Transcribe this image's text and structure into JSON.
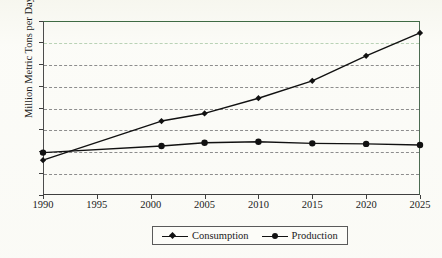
{
  "chart_data": {
    "type": "line",
    "title": "",
    "xlabel": "",
    "ylabel": "Million Metric Tons per Day",
    "xlim": [
      1990,
      2025
    ],
    "ylim": [
      0,
      1.6
    ],
    "ytick_labels": [
      "1.6",
      "1.4",
      "1.2",
      "1",
      "0.8",
      "0.6",
      "0.4",
      "0.2",
      "0"
    ],
    "ytick_values": [
      1.6,
      1.4,
      1.2,
      1.0,
      0.8,
      0.6,
      0.4,
      0.2,
      0
    ],
    "xtick_labels": [
      "1990",
      "1995",
      "2000",
      "2005",
      "2010",
      "2015",
      "2020",
      "2025"
    ],
    "xtick_values": [
      1990,
      1995,
      2000,
      2005,
      2010,
      2015,
      2020,
      2025
    ],
    "grid": true,
    "grid_style": "dashed",
    "legend_position": "bottom-center",
    "x": [
      1990,
      2001,
      2005,
      2010,
      2015,
      2020,
      2025
    ],
    "series": [
      {
        "name": "Consumption",
        "marker": "diamond",
        "color": "#111111",
        "values": [
          0.32,
          0.68,
          0.75,
          0.89,
          1.05,
          1.28,
          1.49
        ]
      },
      {
        "name": "Production",
        "marker": "circle",
        "color": "#111111",
        "values": [
          0.39,
          0.45,
          0.48,
          0.49,
          0.475,
          0.47,
          0.46
        ]
      }
    ]
  },
  "legend": {
    "items": [
      {
        "label": "Consumption",
        "marker": "diamond"
      },
      {
        "label": "Production",
        "marker": "circle"
      }
    ]
  },
  "colors": {
    "frame_top": "#3f6b44",
    "gridline": "#8d8d8d",
    "gridline_light": "#b9d2b6",
    "series_line": "#111111",
    "page_background": "#fbfbf7"
  },
  "artifacts": {
    "top_cut_text": "· · · · · · · · · · · · · · ·"
  }
}
